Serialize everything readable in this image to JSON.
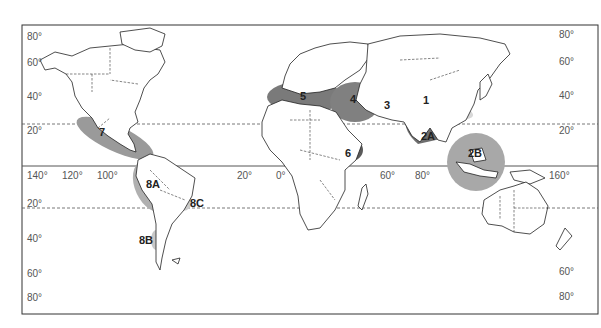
{
  "map": {
    "type": "world map, Miller-like projection, with highlighted regions",
    "left_lat_labels": [
      "80°",
      "60°",
      "40°",
      "20°",
      "20°",
      "40°",
      "60°",
      "80°"
    ],
    "right_lat_labels": [
      "80°",
      "60°",
      "40°",
      "20°",
      "60°",
      "80°"
    ],
    "equator_lon_labels": [
      "140°",
      "120°",
      "100°",
      "20°",
      "0°",
      "60°",
      "80°",
      "160°"
    ],
    "reference_lines": [
      "Equator (solid)",
      "Tropic of Cancer (dashed)",
      "Tropic of Capricorn (dashed)"
    ],
    "regions": [
      {
        "id": "1",
        "label": "1",
        "shade": "light",
        "location": "Central Asia / Tibetan Plateau",
        "color": "#d8d8d8"
      },
      {
        "id": "2A",
        "label": "2A",
        "shade": "dark",
        "location": "Indian subcontinent",
        "color": "#6e6e6e"
      },
      {
        "id": "2B",
        "label": "2B",
        "shade": "medium",
        "location": "Southeast Asia",
        "color": "#a8a8a8"
      },
      {
        "id": "3",
        "label": "3",
        "shade": "light",
        "location": "Central Asia (Turkmenistan/Afghanistan)",
        "color": "#cfcfcf"
      },
      {
        "id": "4",
        "label": "4",
        "shade": "dark",
        "location": "Near East / Fertile Crescent",
        "color": "#808080"
      },
      {
        "id": "5",
        "label": "5",
        "shade": "dark",
        "location": "Mediterranean",
        "color": "#7a7a7a"
      },
      {
        "id": "6",
        "label": "6",
        "shade": "darkest",
        "location": "Ethiopia",
        "color": "#5a5a5a"
      },
      {
        "id": "7",
        "label": "7",
        "shade": "medium",
        "location": "Mexico / Central America",
        "color": "#9a9a9a"
      },
      {
        "id": "8A",
        "label": "8A",
        "shade": "medium",
        "location": "Andes (Peru/Bolivia)",
        "color": "#b0b0b0"
      },
      {
        "id": "8B",
        "label": "8B",
        "shade": "light",
        "location": "Southern Chile",
        "color": "#c8c8c8"
      },
      {
        "id": "8C",
        "label": "8C",
        "shade": "light",
        "location": "Southern Brazil / Paraguay",
        "color": "#cccccc"
      }
    ]
  }
}
